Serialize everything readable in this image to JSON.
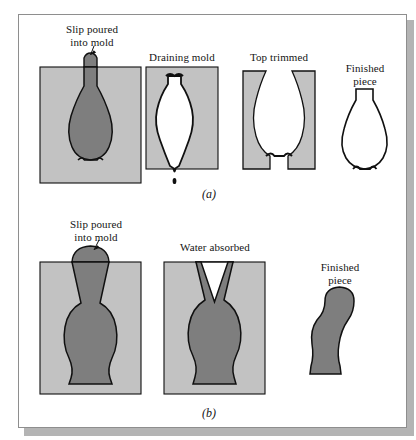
{
  "figure": {
    "title_caption_a": "(a)",
    "title_caption_b": "(b)",
    "colors": {
      "mold": "#c2c2c2",
      "slip": "#7e7e7e",
      "outline": "#101010",
      "cavity": "#ffffff",
      "page": "#ffffff",
      "shadow": "#b4b4b4",
      "border": "#8e8e8e"
    }
  },
  "panel_a": {
    "name": "drain-casting",
    "caption": "(a)",
    "steps": [
      {
        "id": "slip-poured-into-mold",
        "label": "Slip poured\ninto mold",
        "has_leader_line": true
      },
      {
        "id": "draining-mold",
        "label": "Draining mold",
        "has_leader_line": false
      },
      {
        "id": "top-trimmed",
        "label": "Top trimmed",
        "has_leader_line": false
      },
      {
        "id": "finished-piece",
        "label": "Finished\npiece",
        "has_leader_line": false
      }
    ]
  },
  "panel_b": {
    "name": "solid-casting",
    "caption": "(b)",
    "steps": [
      {
        "id": "slip-poured-into-mold",
        "label": "Slip poured\ninto mold",
        "has_leader_line": true
      },
      {
        "id": "water-absorbed",
        "label": "Water absorbed",
        "has_leader_line": false
      },
      {
        "id": "finished-piece",
        "label": "Finished\npiece",
        "has_leader_line": false
      }
    ]
  }
}
